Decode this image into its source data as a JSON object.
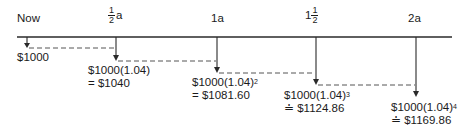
{
  "diagram": {
    "type": "timeline",
    "colors": {
      "line": "#2a2a2a",
      "dashed": "#555555",
      "text": "#1a1a1a"
    },
    "period_labels": [
      {
        "id": "now",
        "text": "Now"
      },
      {
        "id": "half",
        "num": "1",
        "den": "2",
        "suffix": "a"
      },
      {
        "id": "one",
        "text": "1a"
      },
      {
        "id": "one-half",
        "whole": "1",
        "num": "1",
        "den": "2"
      },
      {
        "id": "two",
        "text": "2a"
      }
    ],
    "values": [
      {
        "line1": "$1000"
      },
      {
        "line1": "$1000(1.04)",
        "line2": "= $1040"
      },
      {
        "line1": "$1000(1.04)",
        "exp": "2",
        "line2": "= $1081.60"
      },
      {
        "line1": "$1000(1.04)",
        "exp": "3",
        "line2": "≐ $1124.86"
      },
      {
        "line1": "$1000(1.04)",
        "exp": "4",
        "line2": "≐ $1169.86"
      }
    ]
  }
}
